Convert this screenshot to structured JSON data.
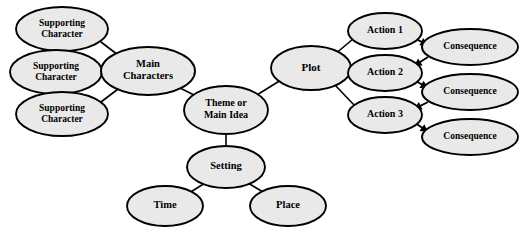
{
  "diagram": {
    "background_color": "#ffffff",
    "node_fill_color": "#e9e9e9",
    "node_stroke_color": "#000000",
    "edge_color": "#000000",
    "text_color": "#000000"
  },
  "nodes": [
    {
      "id": "supporting-character-1",
      "label_line1": "Supporting",
      "label_line2": "Character",
      "cx": 62,
      "cy": 29,
      "rx": 46,
      "ry": 22,
      "font_size": 9.5,
      "two_line": true
    },
    {
      "id": "supporting-character-2",
      "label_line1": "Supporting",
      "label_line2": "Character",
      "cx": 56,
      "cy": 72,
      "rx": 46,
      "ry": 22,
      "font_size": 9.5,
      "two_line": true
    },
    {
      "id": "supporting-character-3",
      "label_line1": "Supporting",
      "label_line2": "Character",
      "cx": 62,
      "cy": 114,
      "rx": 46,
      "ry": 22,
      "font_size": 9.5,
      "two_line": true
    },
    {
      "id": "main-characters",
      "label_line1": "Main",
      "label_line2": "Characters",
      "cx": 148,
      "cy": 71,
      "rx": 47,
      "ry": 24,
      "font_size": 10.5,
      "two_line": true
    },
    {
      "id": "theme-or-main-idea",
      "label_line1": "Theme or",
      "label_line2": "Main Idea",
      "cx": 226,
      "cy": 110,
      "rx": 42,
      "ry": 24,
      "font_size": 10,
      "two_line": true
    },
    {
      "id": "plot",
      "label_line1": "Plot",
      "label_line2": "",
      "cx": 311,
      "cy": 68,
      "rx": 40,
      "ry": 22,
      "font_size": 11,
      "two_line": false
    },
    {
      "id": "action-1",
      "label_line1": "Action 1",
      "label_line2": "",
      "cx": 385,
      "cy": 31,
      "rx": 37,
      "ry": 18,
      "font_size": 10,
      "two_line": false
    },
    {
      "id": "action-2",
      "label_line1": "Action 2",
      "label_line2": "",
      "cx": 385,
      "cy": 73,
      "rx": 37,
      "ry": 18,
      "font_size": 10,
      "two_line": false
    },
    {
      "id": "action-3",
      "label_line1": "Action 3",
      "label_line2": "",
      "cx": 385,
      "cy": 115,
      "rx": 37,
      "ry": 18,
      "font_size": 10,
      "two_line": false
    },
    {
      "id": "consequence-1",
      "label_line1": "Consequence",
      "label_line2": "",
      "cx": 470,
      "cy": 47,
      "rx": 48,
      "ry": 18,
      "font_size": 9.5,
      "two_line": false
    },
    {
      "id": "consequence-2",
      "label_line1": "Consequence",
      "label_line2": "",
      "cx": 470,
      "cy": 92,
      "rx": 48,
      "ry": 18,
      "font_size": 9.5,
      "two_line": false
    },
    {
      "id": "consequence-3",
      "label_line1": "Consequence",
      "label_line2": "",
      "cx": 470,
      "cy": 137,
      "rx": 48,
      "ry": 18,
      "font_size": 9.5,
      "two_line": false
    },
    {
      "id": "setting",
      "label_line1": "Setting",
      "label_line2": "",
      "cx": 226,
      "cy": 167,
      "rx": 39,
      "ry": 21,
      "font_size": 10.5,
      "two_line": false
    },
    {
      "id": "time",
      "label_line1": "Time",
      "label_line2": "",
      "cx": 165,
      "cy": 206,
      "rx": 38,
      "ry": 20,
      "font_size": 10.5,
      "two_line": false
    },
    {
      "id": "place",
      "label_line1": "Place",
      "label_line2": "",
      "cx": 288,
      "cy": 206,
      "rx": 38,
      "ry": 20,
      "font_size": 10.5,
      "two_line": false
    }
  ],
  "edges": [
    {
      "id": "supporting-1-to-main",
      "from": "supporting-character-1",
      "to": "main-characters",
      "x1": 101,
      "y1": 42,
      "x2": 122,
      "y2": 58,
      "arrow": false
    },
    {
      "id": "supporting-2-to-main",
      "from": "supporting-character-2",
      "to": "main-characters",
      "x1": 102,
      "y1": 72,
      "x2": 121,
      "y2": 72,
      "arrow": false
    },
    {
      "id": "supporting-3-to-main",
      "from": "supporting-character-3",
      "to": "main-characters",
      "x1": 101,
      "y1": 102,
      "x2": 122,
      "y2": 86,
      "arrow": false
    },
    {
      "id": "main-to-theme",
      "from": "main-characters",
      "to": "theme-or-main-idea",
      "x1": 180,
      "y1": 88,
      "x2": 202,
      "y2": 99,
      "arrow": false
    },
    {
      "id": "theme-to-plot",
      "from": "theme-or-main-idea",
      "to": "plot",
      "x1": 252,
      "y1": 98,
      "x2": 281,
      "y2": 80,
      "arrow": false
    },
    {
      "id": "plot-to-action-1",
      "from": "plot",
      "to": "action-1",
      "x1": 334,
      "y1": 55,
      "x2": 353,
      "y2": 39,
      "arrow": false
    },
    {
      "id": "plot-to-action-2",
      "from": "plot",
      "to": "action-2",
      "x1": 351,
      "y1": 70,
      "x2": 348,
      "y2": 72,
      "arrow": false
    },
    {
      "id": "plot-to-action-3",
      "from": "plot",
      "to": "action-3",
      "x1": 334,
      "y1": 84,
      "x2": 355,
      "y2": 106,
      "arrow": false
    },
    {
      "id": "action-1-to-consequence-1",
      "from": "action-1",
      "to": "consequence-1",
      "x1": 414,
      "y1": 38,
      "x2": 428,
      "y2": 45,
      "arrow": true
    },
    {
      "id": "consequence-1-to-action-2",
      "from": "consequence-1",
      "to": "action-2",
      "x1": 428,
      "y1": 57,
      "x2": 414,
      "y2": 66,
      "arrow": true
    },
    {
      "id": "action-2-to-consequence-2",
      "from": "action-2",
      "to": "consequence-2",
      "x1": 414,
      "y1": 80,
      "x2": 428,
      "y2": 88,
      "arrow": true
    },
    {
      "id": "consequence-2-to-action-3",
      "from": "consequence-2",
      "to": "action-3",
      "x1": 428,
      "y1": 102,
      "x2": 414,
      "y2": 109,
      "arrow": true
    },
    {
      "id": "action-3-to-consequence-3",
      "from": "action-3",
      "to": "consequence-3",
      "x1": 414,
      "y1": 122,
      "x2": 428,
      "y2": 132,
      "arrow": true
    },
    {
      "id": "theme-to-setting",
      "from": "theme-or-main-idea",
      "to": "setting",
      "x1": 226,
      "y1": 134,
      "x2": 226,
      "y2": 147,
      "arrow": false
    },
    {
      "id": "setting-to-time",
      "from": "setting",
      "to": "time",
      "x1": 205,
      "y1": 183,
      "x2": 186,
      "y2": 195,
      "arrow": false
    },
    {
      "id": "setting-to-place",
      "from": "setting",
      "to": "place",
      "x1": 248,
      "y1": 183,
      "x2": 268,
      "y2": 195,
      "arrow": false
    }
  ]
}
